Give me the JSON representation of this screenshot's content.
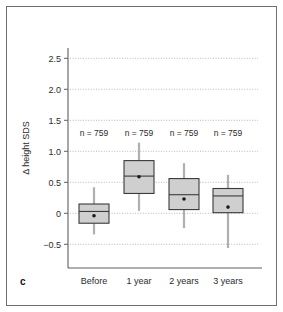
{
  "figure": {
    "panel_letter": "c",
    "background_color": "#ffffff",
    "border_color": "#6f6f6f",
    "box_fill_color": "#cfcfcf",
    "box_edge_color": "#3a3a3a",
    "whisker_color": "#b0b0b0",
    "gridline_color": "#9a9a9a"
  },
  "chart_data": {
    "type": "box",
    "title": "",
    "xlabel": "",
    "ylabel": "Δ height SDS",
    "ylim": [
      -0.85,
      2.85
    ],
    "yticks": [
      -0.5,
      0,
      0.5,
      1.0,
      1.5,
      2.0,
      2.5
    ],
    "ytick_labels": [
      "−0.5",
      "0",
      "0.5",
      "1.0",
      "1.5",
      "2.0",
      "2.5"
    ],
    "grid": true,
    "legend": "none",
    "categories": [
      "Before",
      "1 year",
      "2 years",
      "3 years"
    ],
    "annotations": [
      "n = 759",
      "n = 759",
      "n = 759",
      "n = 759"
    ],
    "annotation_y": 1.25,
    "boxes": [
      {
        "category": "Before",
        "n": 759,
        "whisker_low": -0.34,
        "q1": -0.16,
        "median": 0.03,
        "q3": 0.15,
        "whisker_high": 0.42,
        "mean": -0.04
      },
      {
        "category": "1 year",
        "n": 759,
        "whisker_low": 0.04,
        "q1": 0.32,
        "median": 0.6,
        "q3": 0.85,
        "whisker_high": 1.14,
        "mean": 0.59
      },
      {
        "category": "2 years",
        "n": 759,
        "whisker_low": -0.24,
        "q1": 0.06,
        "median": 0.3,
        "q3": 0.56,
        "whisker_high": 0.81,
        "mean": 0.23
      },
      {
        "category": "3 years",
        "n": 759,
        "whisker_low": -0.56,
        "q1": 0.01,
        "median": 0.28,
        "q3": 0.4,
        "whisker_high": 0.62,
        "mean": 0.1
      }
    ]
  }
}
